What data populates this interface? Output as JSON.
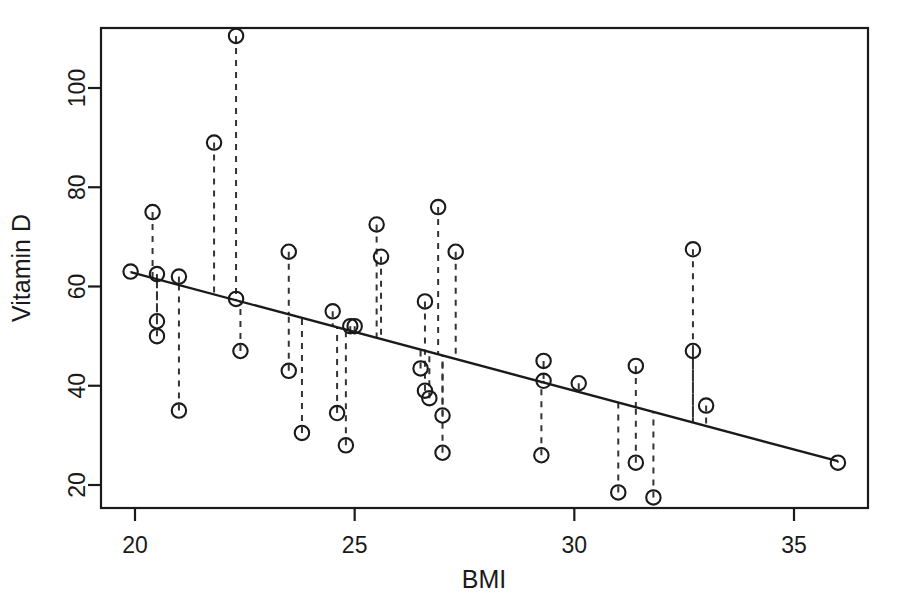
{
  "chart_data": {
    "type": "scatter",
    "title": "",
    "subtitle": "",
    "xlabel": "BMI",
    "ylabel": "Vitamin D",
    "xlim": [
      19.3,
      36.8
    ],
    "ylim": [
      16.5,
      113.0
    ],
    "xticks": [
      20,
      25,
      30,
      35
    ],
    "xticklabels": [
      "20",
      "25",
      "30",
      "35"
    ],
    "yticks": [
      20,
      40,
      60,
      80,
      100
    ],
    "yticklabels": [
      "20",
      "40",
      "60",
      "80",
      "100"
    ],
    "grid": false,
    "legend": false,
    "legend_position": "none",
    "frame": "box",
    "marker": "open-circle",
    "point_color": "#1a1a1a",
    "line_color": "#1a1a1a",
    "residual_style": "dashed",
    "x": [
      19.9,
      20.4,
      20.5,
      20.5,
      20.5,
      21.0,
      21.0,
      21.8,
      22.3,
      22.3,
      22.4,
      23.5,
      23.5,
      23.8,
      24.5,
      24.6,
      24.8,
      24.9,
      25.0,
      25.5,
      25.6,
      26.5,
      26.6,
      26.6,
      26.7,
      26.9,
      27.0,
      27.0,
      27.3,
      29.25,
      29.3,
      29.3,
      30.1,
      31.0,
      31.4,
      31.4,
      31.8,
      32.7,
      32.7,
      33.0,
      36.0
    ],
    "y": [
      63.0,
      75.0,
      62.5,
      53.0,
      50.0,
      35.0,
      62.0,
      89.0,
      110.5,
      57.5,
      47.0,
      67.0,
      43.0,
      30.5,
      55.0,
      34.5,
      28.0,
      52.0,
      52.0,
      72.5,
      66.0,
      43.5,
      57.0,
      39.0,
      37.5,
      76.0,
      34.0,
      26.5,
      67.0,
      26.0,
      45.0,
      41.0,
      40.5,
      18.5,
      24.5,
      44.0,
      17.5,
      67.5,
      47.0,
      36.0,
      24.5
    ],
    "points": [
      {
        "bmi": 19.9,
        "vitamin_d": 63.0,
        "fitted": 62.9
      },
      {
        "bmi": 20.4,
        "vitamin_d": 75.0,
        "fitted": 61.7
      },
      {
        "bmi": 20.5,
        "vitamin_d": 62.5,
        "fitted": 61.5
      },
      {
        "bmi": 20.5,
        "vitamin_d": 53.0,
        "fitted": 61.5
      },
      {
        "bmi": 20.5,
        "vitamin_d": 50.0,
        "fitted": 61.5
      },
      {
        "bmi": 21.0,
        "vitamin_d": 35.0,
        "fitted": 60.3
      },
      {
        "bmi": 21.0,
        "vitamin_d": 62.0,
        "fitted": 60.3
      },
      {
        "bmi": 21.8,
        "vitamin_d": 89.0,
        "fitted": 58.4
      },
      {
        "bmi": 22.3,
        "vitamin_d": 110.5,
        "fitted": 57.2
      },
      {
        "bmi": 22.3,
        "vitamin_d": 57.5,
        "fitted": 57.2
      },
      {
        "bmi": 22.4,
        "vitamin_d": 47.0,
        "fitted": 57.0
      },
      {
        "bmi": 23.5,
        "vitamin_d": 67.0,
        "fitted": 54.4
      },
      {
        "bmi": 23.5,
        "vitamin_d": 43.0,
        "fitted": 54.4
      },
      {
        "bmi": 23.8,
        "vitamin_d": 30.5,
        "fitted": 53.6
      },
      {
        "bmi": 24.5,
        "vitamin_d": 55.0,
        "fitted": 52.0
      },
      {
        "bmi": 24.6,
        "vitamin_d": 34.5,
        "fitted": 51.7
      },
      {
        "bmi": 24.8,
        "vitamin_d": 28.0,
        "fitted": 51.3
      },
      {
        "bmi": 24.9,
        "vitamin_d": 52.0,
        "fitted": 51.0
      },
      {
        "bmi": 25.0,
        "vitamin_d": 52.0,
        "fitted": 50.8
      },
      {
        "bmi": 25.5,
        "vitamin_d": 72.5,
        "fitted": 49.6
      },
      {
        "bmi": 25.6,
        "vitamin_d": 66.0,
        "fitted": 49.4
      },
      {
        "bmi": 26.5,
        "vitamin_d": 43.5,
        "fitted": 47.2
      },
      {
        "bmi": 26.6,
        "vitamin_d": 57.0,
        "fitted": 47.0
      },
      {
        "bmi": 26.6,
        "vitamin_d": 39.0,
        "fitted": 47.0
      },
      {
        "bmi": 26.7,
        "vitamin_d": 37.5,
        "fitted": 46.8
      },
      {
        "bmi": 26.9,
        "vitamin_d": 76.0,
        "fitted": 46.3
      },
      {
        "bmi": 27.0,
        "vitamin_d": 34.0,
        "fitted": 46.1
      },
      {
        "bmi": 27.0,
        "vitamin_d": 26.5,
        "fitted": 46.1
      },
      {
        "bmi": 27.3,
        "vitamin_d": 67.0,
        "fitted": 45.4
      },
      {
        "bmi": 29.25,
        "vitamin_d": 26.0,
        "fitted": 40.8
      },
      {
        "bmi": 29.3,
        "vitamin_d": 45.0,
        "fitted": 40.7
      },
      {
        "bmi": 29.3,
        "vitamin_d": 41.0,
        "fitted": 40.7
      },
      {
        "bmi": 30.1,
        "vitamin_d": 40.5,
        "fitted": 38.8
      },
      {
        "bmi": 31.0,
        "vitamin_d": 18.5,
        "fitted": 36.7
      },
      {
        "bmi": 31.4,
        "vitamin_d": 24.5,
        "fitted": 35.7
      },
      {
        "bmi": 31.4,
        "vitamin_d": 44.0,
        "fitted": 35.7
      },
      {
        "bmi": 31.8,
        "vitamin_d": 17.5,
        "fitted": 34.8
      },
      {
        "bmi": 32.7,
        "vitamin_d": 67.5,
        "fitted": 32.6
      },
      {
        "bmi": 32.7,
        "vitamin_d": 47.0,
        "fitted": 32.6
      },
      {
        "bmi": 33.0,
        "vitamin_d": 36.0,
        "fitted": 31.9
      },
      {
        "bmi": 36.0,
        "vitamin_d": 24.5,
        "fitted": 24.8
      }
    ],
    "regression_line": {
      "x_start": 19.9,
      "y_start": 62.9,
      "x_end": 36.0,
      "y_end": 24.8,
      "slope": -2.367,
      "intercept": 110.0
    }
  },
  "colors": {
    "background": "#ffffff",
    "axis": "#1a1a1a",
    "marker": "#1a1a1a",
    "fit_line": "#1a1a1a",
    "residual": "#333333"
  }
}
